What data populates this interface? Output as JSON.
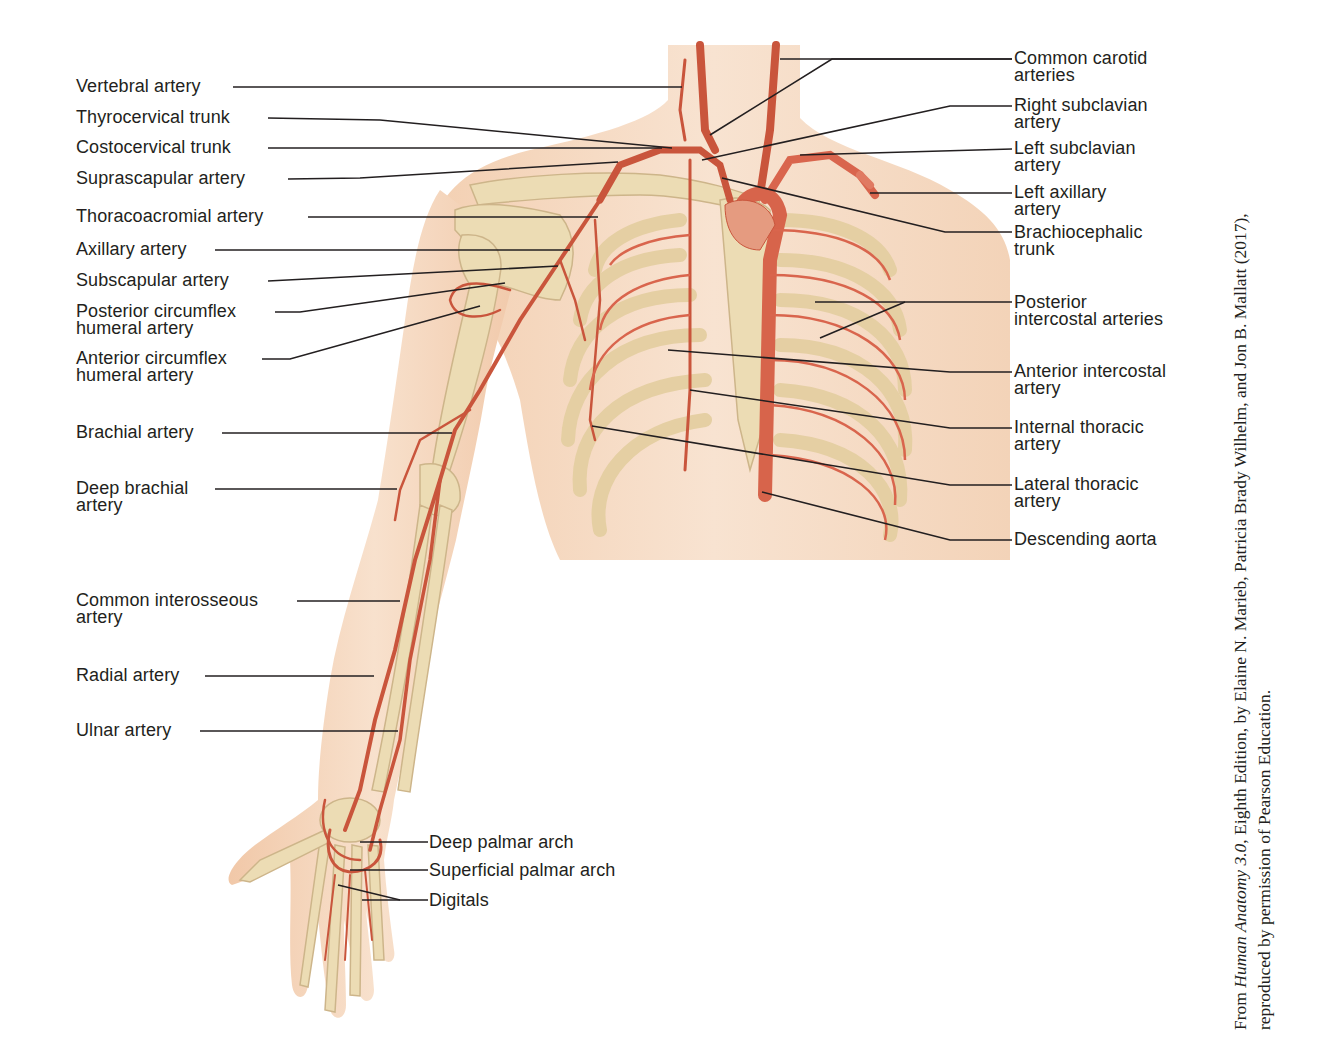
{
  "figure": {
    "colors": {
      "skin": "#f6dcc6",
      "skin_shadow": "#edc4a3",
      "bone": "#ecdcb4",
      "bone_outline": "#cdb58a",
      "artery": "#c9553c",
      "artery_light": "#e07a62",
      "leader": "#231f20",
      "text": "#231f20"
    },
    "left_labels": [
      {
        "text": "Vertebral artery"
      },
      {
        "text": "Thyrocervical trunk"
      },
      {
        "text": "Costocervical trunk"
      },
      {
        "text": "Suprascapular artery"
      },
      {
        "text": "Thoracoacromial artery"
      },
      {
        "text": "Axillary artery"
      },
      {
        "text": "Subscapular artery"
      },
      {
        "text": "Posterior circumflex\nhumeral artery"
      },
      {
        "text": "Anterior circumflex\nhumeral artery"
      },
      {
        "text": "Brachial artery"
      },
      {
        "text": "Deep brachial\nartery"
      },
      {
        "text": "Common interosseous\nartery"
      },
      {
        "text": "Radial artery"
      },
      {
        "text": "Ulnar artery"
      }
    ],
    "right_labels": [
      {
        "text": "Common carotid\narteries"
      },
      {
        "text": "Right subclavian\nartery"
      },
      {
        "text": "Left subclavian\nartery"
      },
      {
        "text": "Left axillary\nartery"
      },
      {
        "text": "Brachiocephalic\ntrunk"
      },
      {
        "text": "Posterior\nintercostal arteries"
      },
      {
        "text": "Anterior intercostal\nartery"
      },
      {
        "text": "Internal thoracic\nartery"
      },
      {
        "text": "Lateral thoracic\nartery"
      },
      {
        "text": "Descending aorta"
      }
    ],
    "hand_labels": [
      {
        "text": "Deep palmar arch"
      },
      {
        "text": "Superficial palmar arch"
      },
      {
        "text": "Digitals"
      }
    ],
    "credit": {
      "prefix": "From ",
      "book_title": "Human Anatomy 3.0",
      "line1_rest": ", Eighth Edition, by Elaine N. Marieb, Patricia Brady Wilhelm, and Jon B. Mallatt (2017),",
      "line2": "reproduced by permission of Pearson Education."
    }
  }
}
